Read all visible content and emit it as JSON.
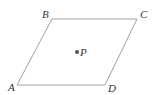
{
  "diagram": {
    "type": "parallelogram-with-interior-point",
    "colors": {
      "edge": "#a0a0a0",
      "point": "#555555",
      "label": "#333333",
      "background": "#ffffff"
    },
    "vertices": [
      {
        "id": "A",
        "label": "A",
        "x": 17,
        "y": 85,
        "label_x": 8,
        "label_y": 91
      },
      {
        "id": "B",
        "label": "B",
        "x": 52,
        "y": 19,
        "label_x": 42,
        "label_y": 18
      },
      {
        "id": "C",
        "label": "C",
        "x": 137,
        "y": 19,
        "label_x": 140,
        "label_y": 18
      },
      {
        "id": "D",
        "label": "D",
        "x": 105,
        "y": 85,
        "label_x": 108,
        "label_y": 92
      }
    ],
    "edges": [
      [
        "A",
        "B"
      ],
      [
        "B",
        "C"
      ],
      [
        "C",
        "D"
      ],
      [
        "D",
        "A"
      ]
    ],
    "points": [
      {
        "id": "P",
        "label": "P",
        "x": 77,
        "y": 52,
        "label_x": 80,
        "label_y": 56
      }
    ]
  }
}
